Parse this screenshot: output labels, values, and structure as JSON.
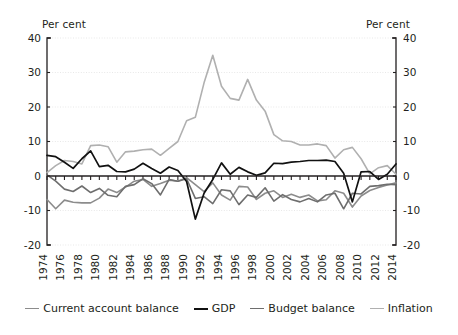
{
  "chart_data": {
    "type": "line",
    "title": "",
    "xlabel": "",
    "ylabel": "Per cent",
    "y_axis_label_left": "Per cent",
    "y_axis_label_right": "Per cent",
    "ylim": [
      -20,
      40
    ],
    "yticks": [
      -20,
      -10,
      0,
      10,
      20,
      30,
      40
    ],
    "ytick_labels_left": [
      "-20",
      "-10",
      "0",
      "10",
      "20",
      "30",
      "40"
    ],
    "ytick_labels_right": [
      "-20",
      "-10",
      "0",
      "10",
      "20",
      "30",
      "40"
    ],
    "xlim": [
      1974,
      2014
    ],
    "x": [
      1974,
      1975,
      1976,
      1977,
      1978,
      1979,
      1980,
      1981,
      1982,
      1983,
      1984,
      1985,
      1986,
      1987,
      1988,
      1989,
      1990,
      1991,
      1992,
      1993,
      1994,
      1995,
      1996,
      1997,
      1998,
      1999,
      2000,
      2001,
      2002,
      2003,
      2004,
      2005,
      2006,
      2007,
      2008,
      2009,
      2010,
      2011,
      2012,
      2013,
      2014
    ],
    "xticks": [
      1974,
      1976,
      1978,
      1980,
      1982,
      1984,
      1986,
      1988,
      1990,
      1992,
      1994,
      1996,
      1998,
      2000,
      2002,
      2004,
      2006,
      2008,
      2010,
      2012,
      2014
    ],
    "xtick_labels": [
      "1974",
      "1976",
      "1978",
      "1980",
      "1982",
      "1984",
      "1986",
      "1988",
      "1990",
      "1992",
      "1994",
      "1996",
      "1998",
      "2000",
      "2002",
      "2004",
      "2006",
      "2008",
      "2010",
      "2012",
      "2014"
    ],
    "grid": true,
    "grid_axis": "y",
    "legend_position": "bottom",
    "series": [
      {
        "name": "Current account balance",
        "color": "#8c8c8c",
        "width": 1.6,
        "values": [
          -6.8,
          -9.5,
          -7.0,
          -7.6,
          -7.8,
          -7.8,
          -6.4,
          -3.8,
          -4.8,
          -3.2,
          -1.5,
          -1.0,
          -3.0,
          -2.2,
          -1.2,
          -1.5,
          -0.5,
          -2.5,
          -4.5,
          -2.0,
          -5.5,
          -7.0,
          -3.0,
          -3.2,
          -6.8,
          -5.0,
          -4.3,
          -6.2,
          -5.3,
          -6.2,
          -5.5,
          -7.2,
          -6.9,
          -4.3,
          -5.0,
          -9.0,
          -5.8,
          -4.2,
          -3.3,
          -2.6,
          -2.0
        ]
      },
      {
        "name": "GDP",
        "color": "#111111",
        "width": 1.7,
        "values": [
          6.0,
          5.6,
          4.0,
          2.2,
          5.0,
          7.3,
          2.7,
          3.1,
          1.3,
          1.2,
          2.0,
          3.7,
          2.2,
          0.8,
          2.6,
          1.6,
          -1.6,
          -12.5,
          -5.0,
          -1.0,
          3.8,
          0.5,
          2.5,
          1.2,
          0.2,
          0.9,
          3.7,
          3.6,
          4.0,
          4.2,
          4.5,
          4.5,
          4.6,
          4.2,
          0.8,
          -7.5,
          1.2,
          1.3,
          -1.0,
          0.5,
          3.5
        ]
      },
      {
        "name": "Budget balance",
        "color": "#6e6e6e",
        "width": 1.6,
        "values": [
          0.3,
          -1.5,
          -3.8,
          -4.5,
          -2.9,
          -4.8,
          -3.6,
          -5.6,
          -6.0,
          -3.0,
          -2.5,
          -0.8,
          -2.2,
          -5.5,
          -1.0,
          -1.5,
          -0.8,
          -6.5,
          -6.0,
          -8.0,
          -4.0,
          -4.3,
          -8.3,
          -5.5,
          -6.2,
          -3.4,
          -7.3,
          -5.4,
          -6.8,
          -7.5,
          -6.5,
          -7.5,
          -5.5,
          -5.0,
          -9.5,
          -5.0,
          -5.2,
          -3.0,
          -2.8,
          -2.4,
          -2.5
        ]
      },
      {
        "name": "Inflation",
        "color": "#b0b0b0",
        "width": 1.6,
        "values": [
          1.0,
          3.0,
          4.5,
          4.2,
          3.5,
          8.8,
          9.0,
          8.5,
          4.0,
          7.0,
          7.2,
          7.6,
          7.8,
          6.0,
          8.0,
          10.0,
          16.0,
          17.0,
          27.0,
          35.0,
          26.0,
          22.5,
          22.0,
          28.0,
          22.0,
          18.8,
          12.0,
          10.2,
          10.0,
          9.0,
          9.0,
          9.3,
          8.8,
          5.2,
          7.6,
          8.3,
          5.0,
          0.6,
          2.4,
          3.0,
          0.5
        ]
      }
    ]
  },
  "legend": {
    "items": [
      {
        "label": "Current account balance",
        "color": "#8c8c8c",
        "width": "1.7px"
      },
      {
        "label": "GDP",
        "color": "#111111",
        "width": "2.2px"
      },
      {
        "label": "Budget balance",
        "color": "#6e6e6e",
        "width": "1.7px"
      },
      {
        "label": "Inflation",
        "color": "#b0b0b0",
        "width": "1.7px"
      }
    ]
  }
}
